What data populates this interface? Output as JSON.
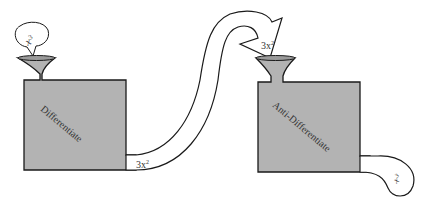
{
  "diagram": {
    "left_machine": {
      "label": "Differentiate",
      "input": "x",
      "input_exp": "3",
      "output": "3x",
      "output_exp": "2"
    },
    "right_machine": {
      "label": "Anti-Differentiate",
      "input": "3x",
      "input_exp": "2",
      "output": "x",
      "output_exp": "3"
    },
    "colors": {
      "machine_fill": "#b3b3b3",
      "outline": "#1a1a1a",
      "pipe_fill": "#ffffff"
    }
  }
}
